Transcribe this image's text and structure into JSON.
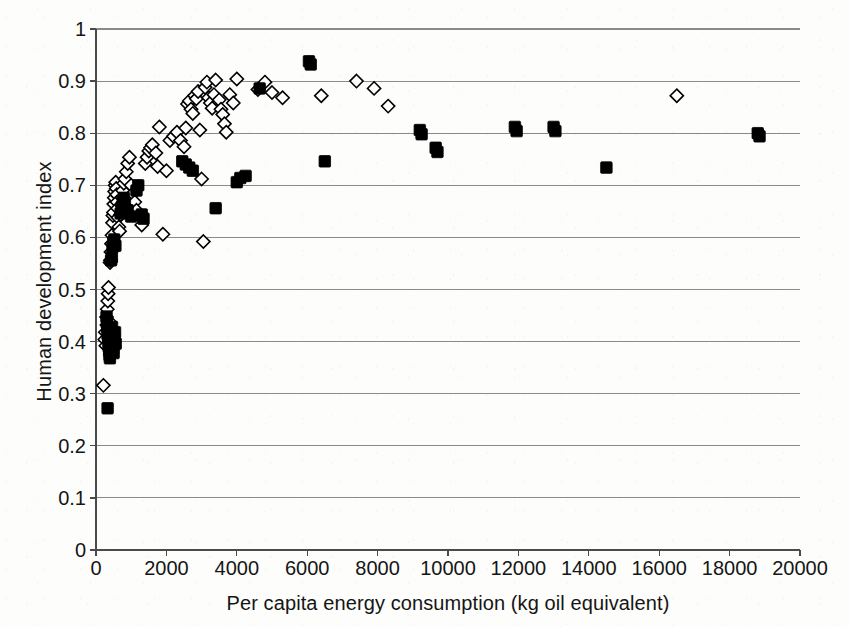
{
  "chart_data": {
    "type": "scatter",
    "title": "",
    "xlabel": "Per capita energy consumption (kg oil equivalent)",
    "ylabel": "Human development index",
    "xlim": [
      0,
      20000
    ],
    "ylim": [
      0,
      1
    ],
    "xticks": [
      0,
      2000,
      4000,
      6000,
      8000,
      10000,
      12000,
      14000,
      16000,
      18000,
      20000
    ],
    "xtick_labels": [
      "0",
      "2000",
      "4000",
      "6000",
      "8000",
      "10000",
      "12000",
      "14000",
      "16000",
      "18000",
      "20000"
    ],
    "yticks": [
      0,
      0.1,
      0.2,
      0.3,
      0.4,
      0.5,
      0.6,
      0.7,
      0.8,
      0.9,
      1
    ],
    "ytick_labels": [
      "0",
      "0.1",
      "0.2",
      "0.3",
      "0.4",
      "0.5",
      "0.6",
      "0.7",
      "0.8",
      "0.9",
      "1"
    ],
    "grid": "horizontal",
    "legend": "none",
    "series": [
      {
        "name": "open-diamond-series",
        "marker": "diamond-open",
        "color": "#000000",
        "fill": "none",
        "points": [
          [
            210,
            0.316
          ],
          [
            250,
            0.404
          ],
          [
            265,
            0.418
          ],
          [
            280,
            0.392
          ],
          [
            300,
            0.447
          ],
          [
            310,
            0.432
          ],
          [
            320,
            0.462
          ],
          [
            335,
            0.478
          ],
          [
            345,
            0.492
          ],
          [
            355,
            0.504
          ],
          [
            360,
            0.412
          ],
          [
            370,
            0.398
          ],
          [
            385,
            0.438
          ],
          [
            400,
            0.552
          ],
          [
            410,
            0.556
          ],
          [
            425,
            0.572
          ],
          [
            440,
            0.588
          ],
          [
            455,
            0.604
          ],
          [
            470,
            0.628
          ],
          [
            480,
            0.642
          ],
          [
            495,
            0.648
          ],
          [
            505,
            0.664
          ],
          [
            520,
            0.676
          ],
          [
            530,
            0.688
          ],
          [
            545,
            0.7
          ],
          [
            560,
            0.706
          ],
          [
            575,
            0.694
          ],
          [
            590,
            0.682
          ],
          [
            600,
            0.668
          ],
          [
            615,
            0.656
          ],
          [
            630,
            0.638
          ],
          [
            650,
            0.62
          ],
          [
            670,
            0.612
          ],
          [
            700,
            0.644
          ],
          [
            720,
            0.662
          ],
          [
            740,
            0.676
          ],
          [
            760,
            0.69
          ],
          [
            790,
            0.704
          ],
          [
            820,
            0.712
          ],
          [
            860,
            0.726
          ],
          [
            900,
            0.742
          ],
          [
            950,
            0.754
          ],
          [
            1000,
            0.7
          ],
          [
            1050,
            0.684
          ],
          [
            1100,
            0.668
          ],
          [
            1150,
            0.652
          ],
          [
            1250,
            0.64
          ],
          [
            1300,
            0.624
          ],
          [
            1400,
            0.742
          ],
          [
            1450,
            0.754
          ],
          [
            1500,
            0.766
          ],
          [
            1550,
            0.772
          ],
          [
            1600,
            0.778
          ],
          [
            1700,
            0.762
          ],
          [
            1750,
            0.736
          ],
          [
            1800,
            0.812
          ],
          [
            1900,
            0.606
          ],
          [
            2000,
            0.728
          ],
          [
            2100,
            0.786
          ],
          [
            2200,
            0.794
          ],
          [
            2300,
            0.802
          ],
          [
            2400,
            0.786
          ],
          [
            2500,
            0.774
          ],
          [
            2550,
            0.81
          ],
          [
            2600,
            0.856
          ],
          [
            2650,
            0.862
          ],
          [
            2700,
            0.846
          ],
          [
            2750,
            0.838
          ],
          [
            2800,
            0.872
          ],
          [
            2850,
            0.866
          ],
          [
            2900,
            0.88
          ],
          [
            2950,
            0.806
          ],
          [
            3000,
            0.712
          ],
          [
            3050,
            0.592
          ],
          [
            3100,
            0.888
          ],
          [
            3150,
            0.898
          ],
          [
            3200,
            0.868
          ],
          [
            3250,
            0.858
          ],
          [
            3300,
            0.848
          ],
          [
            3350,
            0.874
          ],
          [
            3400,
            0.902
          ],
          [
            3500,
            0.864
          ],
          [
            3550,
            0.846
          ],
          [
            3600,
            0.836
          ],
          [
            3650,
            0.818
          ],
          [
            3700,
            0.802
          ],
          [
            3800,
            0.874
          ],
          [
            3900,
            0.858
          ],
          [
            4000,
            0.904
          ],
          [
            4600,
            0.884
          ],
          [
            4800,
            0.898
          ],
          [
            5000,
            0.878
          ],
          [
            5300,
            0.868
          ],
          [
            6400,
            0.872
          ],
          [
            7400,
            0.9
          ],
          [
            7900,
            0.886
          ],
          [
            8300,
            0.852
          ],
          [
            16500,
            0.872
          ]
        ]
      },
      {
        "name": "filled-square-series",
        "marker": "square-filled",
        "color": "#000000",
        "fill": "#000000",
        "points": [
          [
            330,
            0.272
          ],
          [
            300,
            0.448
          ],
          [
            310,
            0.436
          ],
          [
            320,
            0.426
          ],
          [
            330,
            0.414
          ],
          [
            345,
            0.406
          ],
          [
            355,
            0.398
          ],
          [
            365,
            0.39
          ],
          [
            375,
            0.382
          ],
          [
            385,
            0.374
          ],
          [
            395,
            0.368
          ],
          [
            420,
            0.404
          ],
          [
            430,
            0.412
          ],
          [
            440,
            0.42
          ],
          [
            455,
            0.428
          ],
          [
            470,
            0.4
          ],
          [
            480,
            0.392
          ],
          [
            490,
            0.386
          ],
          [
            500,
            0.378
          ],
          [
            520,
            0.408
          ],
          [
            540,
            0.418
          ],
          [
            560,
            0.396
          ],
          [
            430,
            0.556
          ],
          [
            450,
            0.562
          ],
          [
            470,
            0.582
          ],
          [
            490,
            0.59
          ],
          [
            520,
            0.596
          ],
          [
            550,
            0.584
          ],
          [
            700,
            0.646
          ],
          [
            730,
            0.658
          ],
          [
            760,
            0.668
          ],
          [
            790,
            0.676
          ],
          [
            820,
            0.662
          ],
          [
            900,
            0.652
          ],
          [
            1000,
            0.64
          ],
          [
            1150,
            0.69
          ],
          [
            1200,
            0.7
          ],
          [
            1300,
            0.644
          ],
          [
            1350,
            0.636
          ],
          [
            2450,
            0.746
          ],
          [
            2550,
            0.74
          ],
          [
            2650,
            0.734
          ],
          [
            2750,
            0.728
          ],
          [
            3400,
            0.656
          ],
          [
            4000,
            0.706
          ],
          [
            4100,
            0.714
          ],
          [
            4250,
            0.718
          ],
          [
            4650,
            0.886
          ],
          [
            6050,
            0.938
          ],
          [
            6100,
            0.932
          ],
          [
            6500,
            0.746
          ],
          [
            9200,
            0.806
          ],
          [
            9250,
            0.798
          ],
          [
            9650,
            0.772
          ],
          [
            9700,
            0.764
          ],
          [
            11900,
            0.812
          ],
          [
            11950,
            0.804
          ],
          [
            13000,
            0.812
          ],
          [
            13050,
            0.804
          ],
          [
            14500,
            0.734
          ],
          [
            18800,
            0.8
          ],
          [
            18850,
            0.794
          ]
        ]
      }
    ]
  },
  "axes": {
    "plot_left_px": 96,
    "plot_right_px": 800,
    "plot_top_px": 29,
    "plot_bottom_px": 550,
    "grid_color": "#8a8a8a",
    "axis_color": "#4a4a4a"
  }
}
